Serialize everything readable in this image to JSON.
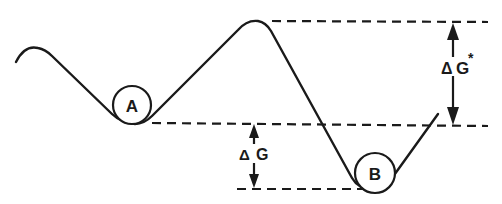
{
  "diagram": {
    "type": "energy-landscape",
    "states": [
      {
        "id": "A",
        "label": "A",
        "role": "initial-state"
      },
      {
        "id": "B",
        "label": "B",
        "role": "final-state"
      }
    ],
    "annotations": {
      "activation_energy": {
        "delta": "Δ",
        "symbol": "G",
        "superscript": "*"
      },
      "free_energy_change": {
        "delta": "Δ",
        "symbol": "G"
      }
    },
    "colors": {
      "stroke": "#1a1a1a",
      "background": "#ffffff"
    }
  }
}
